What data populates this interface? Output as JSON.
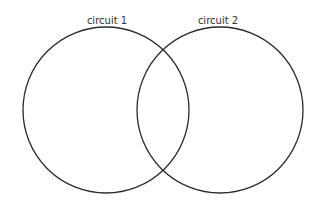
{
  "diagram": {
    "type": "venn",
    "sets": [
      {
        "label": "circuit 1",
        "cx": 106,
        "cy": 110,
        "r": 83
      },
      {
        "label": "circuit 2",
        "cx": 220,
        "cy": 110,
        "r": 83
      }
    ],
    "stroke_color": "#2b2b2b",
    "background": "#ffffff"
  }
}
